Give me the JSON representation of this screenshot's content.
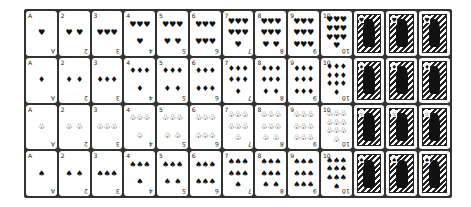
{
  "deck": {
    "ranks": [
      "A",
      "2",
      "3",
      "4",
      "5",
      "6",
      "7",
      "8",
      "9",
      "10",
      "J",
      "Q",
      "K"
    ],
    "pip_counts": [
      1,
      2,
      3,
      4,
      5,
      6,
      7,
      8,
      9,
      10,
      0,
      0,
      0
    ],
    "suits": [
      {
        "name": "hearts",
        "glyph": "♥"
      },
      {
        "name": "diamonds",
        "glyph": "♦"
      },
      {
        "name": "clubs",
        "glyph": "♧"
      },
      {
        "name": "spades",
        "glyph": "♠"
      }
    ]
  }
}
